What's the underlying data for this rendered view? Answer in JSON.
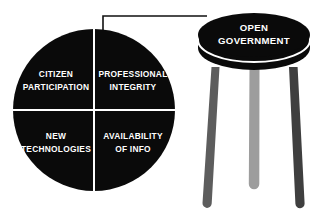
{
  "diagram": {
    "background_color": "#ffffff"
  },
  "wheel": {
    "shape": "circle",
    "fill_color": "#0a0a0a",
    "divider_color": "#ffffff",
    "center_x": 94,
    "center_y": 110,
    "radius": 81,
    "quadrants": [
      {
        "position": "top-left",
        "line1": "CITIZEN",
        "line2": "PARTICIPATION"
      },
      {
        "position": "top-right",
        "line1": "PROFESSIONAL",
        "line2": "INTEGRITY"
      },
      {
        "position": "bottom-left",
        "line1": "NEW",
        "line2": "TECHNOLOGIES"
      },
      {
        "position": "bottom-right",
        "line1": "AVAILABILITY",
        "line2": "OF INFO"
      }
    ]
  },
  "connector": {
    "color": "#111111",
    "shape": "bracket"
  },
  "stool": {
    "seat_label_line1": "OPEN",
    "seat_label_line2": "GOVERNMENT",
    "seat_color": "#0a0a0a",
    "seat_highlight_color": "#ffffff",
    "legs": [
      {
        "name": "left-leg",
        "color": "#5d5d5d"
      },
      {
        "name": "middle-leg",
        "color": "#9d9d9d"
      },
      {
        "name": "right-leg",
        "color": "#3f3f3f"
      }
    ]
  }
}
